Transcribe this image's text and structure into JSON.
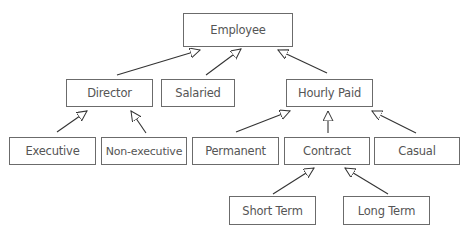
{
  "diagram": {
    "type": "class-hierarchy",
    "nodes": {
      "employee": "Employee",
      "director": "Director",
      "salaried": "Salaried",
      "hourly_paid": "Hourly Paid",
      "executive": "Executive",
      "non_executive": "Non-executive",
      "permanent": "Permanent",
      "contract": "Contract",
      "casual": "Casual",
      "short_term": "Short Term",
      "long_term": "Long Term"
    },
    "edges": [
      {
        "from": "Director",
        "to": "Employee",
        "type": "generalization"
      },
      {
        "from": "Salaried",
        "to": "Employee",
        "type": "generalization"
      },
      {
        "from": "Hourly Paid",
        "to": "Employee",
        "type": "generalization"
      },
      {
        "from": "Executive",
        "to": "Director",
        "type": "generalization"
      },
      {
        "from": "Non-executive",
        "to": "Director",
        "type": "generalization"
      },
      {
        "from": "Permanent",
        "to": "Hourly Paid",
        "type": "generalization"
      },
      {
        "from": "Contract",
        "to": "Hourly Paid",
        "type": "generalization"
      },
      {
        "from": "Casual",
        "to": "Hourly Paid",
        "type": "generalization"
      },
      {
        "from": "Short Term",
        "to": "Contract",
        "type": "generalization"
      },
      {
        "from": "Long Term",
        "to": "Contract",
        "type": "generalization"
      }
    ],
    "colors": {
      "stroke": "#333333",
      "box_border": "#6b6b6b",
      "text": "#555555"
    }
  }
}
